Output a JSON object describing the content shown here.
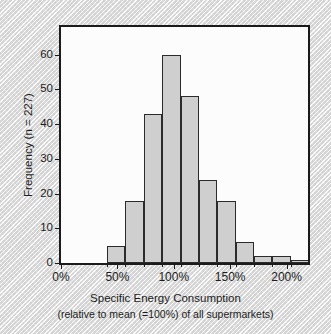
{
  "chart_data": {
    "type": "bar",
    "title": "",
    "subtitle": "",
    "xlabel": "Specific Energy Consumption",
    "xlabel_sub": "(relative to mean (=100%) of all supermarkets)",
    "ylabel": "Frequency (n = 227)",
    "grid": false,
    "legend": false,
    "xlim": [
      0,
      219
    ],
    "ylim": [
      0,
      68
    ],
    "xtick_labels": [
      "0%",
      "50%",
      "100%",
      "150%",
      "200%"
    ],
    "xtick_values": [
      0,
      50,
      100,
      150,
      200
    ],
    "ytick_labels": [
      "0",
      "10",
      "20",
      "30",
      "40",
      "50",
      "60"
    ],
    "ytick_values": [
      0,
      10,
      20,
      30,
      40,
      50,
      60
    ],
    "bin_width": 16.3,
    "bins": [
      {
        "start": 40.8,
        "end": 57.1,
        "value": 5
      },
      {
        "start": 57.1,
        "end": 73.4,
        "value": 18
      },
      {
        "start": 73.4,
        "end": 89.7,
        "value": 43
      },
      {
        "start": 89.7,
        "end": 106.0,
        "value": 60
      },
      {
        "start": 106.0,
        "end": 122.3,
        "value": 48
      },
      {
        "start": 122.3,
        "end": 138.6,
        "value": 24
      },
      {
        "start": 138.6,
        "end": 154.9,
        "value": 18
      },
      {
        "start": 154.9,
        "end": 171.2,
        "value": 6
      },
      {
        "start": 171.2,
        "end": 187.5,
        "value": 2
      },
      {
        "start": 187.5,
        "end": 203.8,
        "value": 2
      },
      {
        "start": 203.8,
        "end": 220.1,
        "value": 1
      }
    ],
    "n_total": 227,
    "bar_fill_color": "#cfcfcf",
    "bar_edge_color": "#2b2b2b",
    "axis_color": "#1b1b1b",
    "plot_background": "#fcfcfc"
  }
}
